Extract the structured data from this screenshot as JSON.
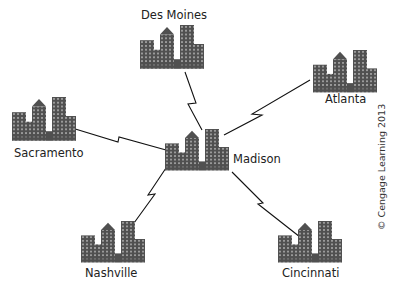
{
  "diagram": {
    "type": "network-topology",
    "hub": "Madison",
    "nodes": [
      {
        "id": "des-moines",
        "label": "Des Moines",
        "x": 172,
        "y": 68
      },
      {
        "id": "atlanta",
        "label": "Atlanta",
        "x": 345,
        "y": 92
      },
      {
        "id": "sacramento",
        "label": "Sacramento",
        "x": 42,
        "y": 122
      },
      {
        "id": "madison",
        "label": "Madison",
        "x": 205,
        "y": 160
      },
      {
        "id": "nashville",
        "label": "Nashville",
        "x": 110,
        "y": 262
      },
      {
        "id": "cincinnati",
        "label": "Cincinnati",
        "x": 312,
        "y": 262
      }
    ],
    "links": [
      {
        "from": "madison",
        "to": "des-moines",
        "style": "lightning"
      },
      {
        "from": "madison",
        "to": "atlanta",
        "style": "lightning"
      },
      {
        "from": "madison",
        "to": "sacramento",
        "style": "lightning"
      },
      {
        "from": "madison",
        "to": "nashville",
        "style": "lightning"
      },
      {
        "from": "madison",
        "to": "cincinnati",
        "style": "lightning"
      }
    ],
    "colors": {
      "building": "#555555",
      "window": "#9a9a9a",
      "line": "#111111"
    }
  },
  "labels": {
    "des_moines": "Des Moines",
    "atlanta": "Atlanta",
    "sacramento": "Sacramento",
    "madison": "Madison",
    "nashville": "Nashville",
    "cincinnati": "Cincinnati"
  },
  "credit": "© Cengage Learning 2013"
}
